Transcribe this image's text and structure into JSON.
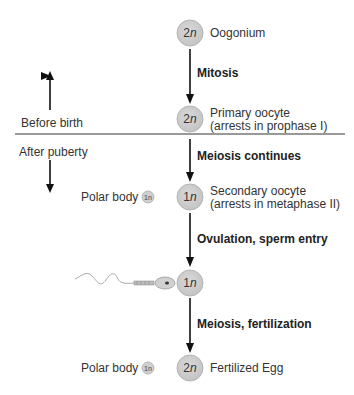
{
  "diagram": {
    "colors": {
      "cell_fill": "#cfcfcf",
      "cell_stroke": "#aaaaaa",
      "arrow": "#111111",
      "divider": "#777777",
      "sperm": "#999999"
    },
    "timeline": {
      "before": "Before birth",
      "after": "After puberty"
    },
    "stages": [
      {
        "ploidy_num": "2",
        "ploidy_n": "n",
        "label_line1": "Oogonium",
        "label_line2": ""
      },
      {
        "ploidy_num": "2",
        "ploidy_n": "n",
        "label_line1": "Primary oocyte",
        "label_line2": "(arrests in prophase I)"
      },
      {
        "ploidy_num": "1",
        "ploidy_n": "n",
        "label_line1": "Secondary oocyte",
        "label_line2": "(arrests in metaphase II)"
      },
      {
        "ploidy_num": "1",
        "ploidy_n": "n",
        "label_line1": "",
        "label_line2": ""
      },
      {
        "ploidy_num": "2",
        "ploidy_n": "n",
        "label_line1": "Fertilized Egg",
        "label_line2": ""
      }
    ],
    "transitions": [
      "Mitosis",
      "Meiosis continues",
      "Ovulation, sperm entry",
      "Meiosis, fertilization"
    ],
    "polar_bodies": [
      {
        "label": "Polar body",
        "ploidy": "1n"
      },
      {
        "label": "Polar body",
        "ploidy": "1n"
      }
    ]
  }
}
